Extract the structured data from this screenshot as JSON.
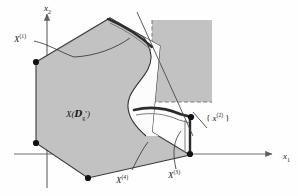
{
  "figure": {
    "axes": {
      "x_axis_label": "x",
      "x_axis_subscript": "1",
      "y_axis_label": "x",
      "y_axis_subscript": "2"
    },
    "labels": {
      "x1_vertex": {
        "base": "X",
        "superscript": "(1)"
      },
      "x2_set": {
        "prefix": "{ ",
        "base": "x",
        "superscript": "(2)",
        "suffix": " }"
      },
      "x3_vertex": {
        "base": "X",
        "superscript": "(3)"
      },
      "x4_vertex": {
        "base": "X",
        "superscript": "(4)"
      },
      "main_set": {
        "open": "X(",
        "symbol": "D",
        "subscript": "g",
        "prime": "'",
        "close": ")"
      }
    },
    "colors": {
      "region_fill": "#c2c2c2",
      "box_fill": "#c2c2c2",
      "outline": "#2b2b2b",
      "axis": "#6e6e6e",
      "notch_fill": "#fcfcfc",
      "background": "#fefefe",
      "vertex_dot": "#121212"
    },
    "geometry": {
      "polygon_vertices": [
        [
          36,
          62
        ],
        [
          110,
          18
        ],
        [
          160,
          46
        ],
        [
          152,
          132
        ],
        [
          190,
          155
        ],
        [
          88,
          178
        ],
        [
          36,
          143
        ]
      ],
      "box": {
        "x": 152,
        "y": 20,
        "width": 60,
        "height": 82
      },
      "marked_points": [
        {
          "name": "x1-vertex-dot",
          "x": 36,
          "y": 62
        },
        {
          "name": "left-lower-dot",
          "x": 36,
          "y": 143
        },
        {
          "name": "bottom-dot",
          "x": 88,
          "y": 178
        },
        {
          "name": "x2-dot",
          "x": 191,
          "y": 117
        },
        {
          "name": "x3-dot",
          "x": 190,
          "y": 154
        }
      ]
    }
  }
}
